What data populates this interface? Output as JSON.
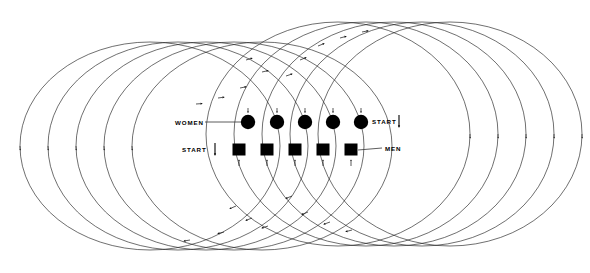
{
  "diagram": {
    "background_color": "#ffffff",
    "line_color": "#1a1a1a",
    "marker_color": "#000000",
    "canvas": {
      "width": 590,
      "height": 273
    }
  },
  "labels": {
    "women": {
      "text": "WOMEN",
      "x": 175,
      "y": 124
    },
    "men": {
      "text": "MEN",
      "x": 385,
      "y": 150
    },
    "start_left": {
      "text": "START",
      "x": 182,
      "y": 150
    },
    "start_right": {
      "text": "START",
      "x": 372,
      "y": 122
    }
  },
  "markers": {
    "women_symbol": "circle",
    "men_symbol": "square",
    "women_row_y": 122,
    "men_row_y": 150,
    "women_radius": 7,
    "men_size": 13,
    "women_x": [
      248,
      277,
      305,
      333,
      361
    ],
    "men_x": [
      239,
      267,
      295,
      323,
      351
    ]
  },
  "start_arrows": {
    "glyph": "down-arrow",
    "left_x": 215,
    "left_y": 150,
    "right_x": 399,
    "right_y": 122
  },
  "tracks": {
    "left_group": {
      "count": 5,
      "direction": "clockwise",
      "center_y": 146,
      "centers_x": [
        150,
        178,
        206,
        234,
        262
      ],
      "rx": 130,
      "ry": 104
    },
    "right_group": {
      "count": 5,
      "direction": "clockwise",
      "center_y": 134,
      "centers_x": [
        338,
        366,
        394,
        422,
        450
      ],
      "rx": 132,
      "ry": 112
    }
  },
  "legend": {
    "circle_meaning": "WOMEN",
    "square_meaning": "MEN"
  }
}
